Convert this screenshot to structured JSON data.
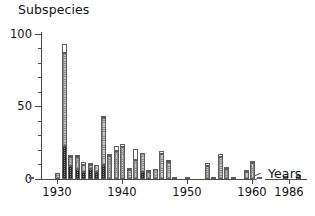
{
  "chart_title": "Subspecies",
  "xaxis_label": "Years",
  "axis": {
    "y_major_labels": [
      "0",
      "50",
      "100"
    ],
    "x_labels": [
      "1930",
      "1940",
      "1950",
      "1960",
      "1986"
    ]
  },
  "legend": {
    "segments": [
      "dark-dotted",
      "mid-gray",
      "white"
    ]
  },
  "chart_data": {
    "type": "bar",
    "title": "Subspecies",
    "xlabel": "Years",
    "ylabel": "Subspecies",
    "ylim": [
      0,
      100
    ],
    "ytick_major": [
      0,
      50,
      100
    ],
    "ytick_minor": [
      10,
      20,
      30,
      40,
      60,
      70,
      80,
      90
    ],
    "xlim": [
      1926,
      1986
    ],
    "xtick_labels": [
      1930,
      1940,
      1950,
      1960,
      1986
    ],
    "grid": false,
    "legend_position": "none",
    "stacked": true,
    "axis_break_after": 1961,
    "series": [
      {
        "name": "dark-dotted",
        "values": [
          0,
          0,
          0,
          0,
          0,
          23,
          9,
          7,
          5,
          7,
          5,
          10,
          0,
          0,
          0,
          0,
          0,
          5,
          0,
          0,
          0,
          0,
          0,
          0,
          0,
          0,
          0,
          0,
          0,
          0,
          0,
          1,
          0,
          0,
          0,
          0,
          0,
          0,
          0,
          0,
          0,
          0,
          0,
          0,
          0,
          0,
          0,
          0,
          0,
          0,
          0,
          0,
          0,
          0,
          0,
          0,
          0,
          0,
          0,
          0,
          0
        ]
      },
      {
        "name": "mid-gray",
        "values": [
          1,
          0,
          0,
          0,
          4,
          64,
          6,
          8,
          5,
          3,
          5,
          32,
          16,
          19,
          22,
          6,
          13,
          13,
          5,
          7,
          17,
          12,
          1,
          0,
          1,
          0,
          0,
          9,
          1,
          15,
          7,
          0,
          0,
          5,
          11,
          1,
          0,
          0,
          0,
          0,
          0,
          3,
          0,
          0,
          0,
          0,
          0,
          0,
          0,
          0,
          0,
          0,
          0,
          0,
          0,
          0,
          0,
          0,
          0,
          0,
          2
        ]
      },
      {
        "name": "white",
        "values": [
          0,
          0,
          0,
          0,
          0,
          6,
          1,
          1,
          2,
          1,
          0,
          1,
          1,
          4,
          2,
          1,
          8,
          0,
          1,
          0,
          2,
          1,
          0,
          0,
          0,
          0,
          0,
          2,
          0,
          2,
          1,
          0,
          0,
          1,
          1,
          0,
          0,
          0,
          0,
          0,
          0,
          0,
          0,
          0,
          0,
          0,
          0,
          0,
          0,
          0,
          0,
          0,
          0,
          0,
          0,
          0,
          0,
          0,
          0,
          0,
          0
        ]
      },
      {
        "name": "total",
        "values": [
          1,
          0,
          0,
          0,
          4,
          93,
          16,
          16,
          12,
          11,
          10,
          43,
          17,
          23,
          24,
          7,
          21,
          18,
          6,
          7,
          19,
          13,
          1,
          0,
          1,
          0,
          0,
          11,
          1,
          17,
          8,
          1,
          0,
          6,
          12,
          1,
          0,
          0,
          0,
          0,
          0,
          3,
          0,
          0,
          0,
          0,
          0,
          0,
          0,
          0,
          0,
          0,
          0,
          0,
          0,
          0,
          0,
          0,
          0,
          0,
          2
        ]
      }
    ],
    "x": [
      1926,
      1927,
      1928,
      1929,
      1930,
      1931,
      1932,
      1933,
      1934,
      1935,
      1936,
      1937,
      1938,
      1939,
      1940,
      1941,
      1942,
      1943,
      1944,
      1945,
      1946,
      1947,
      1948,
      1949,
      1950,
      1951,
      1952,
      1953,
      1954,
      1955,
      1956,
      1957,
      1958,
      1959,
      1960,
      1961,
      1962,
      1963,
      1964,
      1965,
      1966,
      1967,
      1968,
      1969,
      1970,
      1971,
      1972,
      1973,
      1974,
      1975,
      1976,
      1977,
      1978,
      1979,
      1980,
      1981,
      1982,
      1983,
      1984,
      1985,
      1986
    ]
  },
  "geometry": {
    "plot_left": 41,
    "plot_top": 32,
    "plot_w": 266,
    "plot_h": 147,
    "y_zero_px": 178.5,
    "y_per_unit": 1.45,
    "x_1930_px": 57,
    "px_per_year": 6.5,
    "bar_w": 5
  }
}
